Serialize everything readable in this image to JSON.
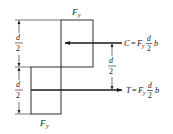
{
  "diagram": {
    "type": "stress-block",
    "top_block_label": "F",
    "top_block_sub": "y",
    "bottom_block_label": "F",
    "bottom_block_sub": "y",
    "left_dims": [
      {
        "num": "d",
        "den": "2"
      },
      {
        "num": "d",
        "den": "2"
      }
    ],
    "lever_arm": {
      "num": "d",
      "den": "2"
    },
    "compression": {
      "symbol": "C",
      "eq": "=",
      "F": "F",
      "sub": "y",
      "num": "d",
      "den": "2",
      "tail": "b",
      "direction": "left"
    },
    "tension": {
      "symbol": "T",
      "eq": "=",
      "F": "F",
      "sub": "y",
      "num": "d",
      "den": "2",
      "tail": "b",
      "direction": "right"
    }
  }
}
